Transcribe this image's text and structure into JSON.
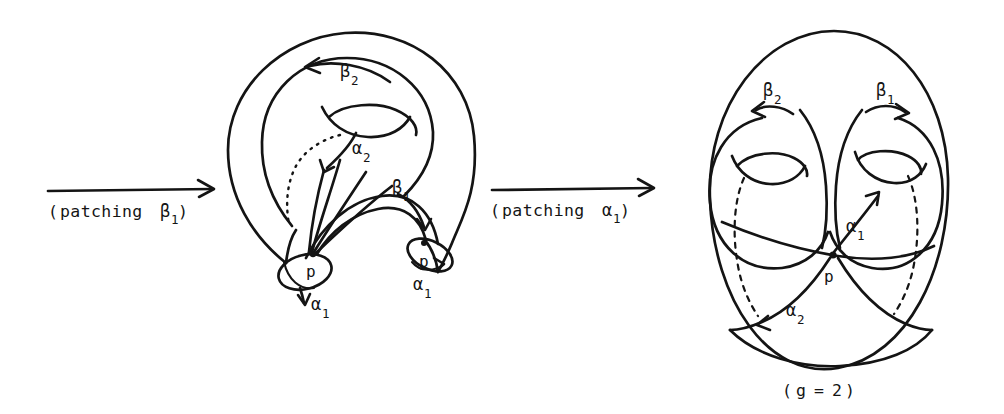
{
  "figure": {
    "kind": "mathematical-diagram",
    "background_color": "#ffffff",
    "ink_color": "#141414"
  },
  "transitions": [
    {
      "id": "arrow-patching-beta1",
      "open_paren": "(",
      "word": "patching",
      "symbol": "β",
      "subscript": "1",
      "close_paren": ")",
      "full_label": "(patching β₁)",
      "direction": "right"
    },
    {
      "id": "arrow-patching-alpha1",
      "open_paren": "(",
      "word": "patching",
      "symbol": "α",
      "subscript": "1",
      "close_paren": ")",
      "full_label": "(patching α₁)",
      "direction": "right"
    }
  ],
  "middle_figure": {
    "id": "surface-with-two-boundary-tubes",
    "description": "genus-one body with one hole and two open tubes ending in elliptical boundary circles",
    "labels": {
      "beta2": {
        "symbol": "β",
        "subscript": "2",
        "arrow_direction": "left"
      },
      "alpha2": {
        "symbol": "α",
        "subscript": "2",
        "arrow_direction": "down"
      },
      "beta1": {
        "symbol": "β",
        "subscript": "1",
        "arrow_direction": "down"
      },
      "alpha1_left": {
        "symbol": "α",
        "subscript": "1",
        "arrow_direction": "down"
      },
      "alpha1_right": {
        "symbol": "α",
        "subscript": "1",
        "arrow_direction": "right"
      }
    },
    "basepoints": [
      {
        "label": "p",
        "position": "left-tube-boundary"
      },
      {
        "label": "p",
        "position": "right-tube-boundary"
      }
    ]
  },
  "right_figure": {
    "id": "genus-two-surface",
    "description": "closed genus-two surface with two handles and four curves meeting at basepoint p",
    "labels": {
      "beta2": {
        "symbol": "β",
        "subscript": "2",
        "arrow_direction": "left"
      },
      "beta1": {
        "symbol": "β",
        "subscript": "1",
        "arrow_direction": "right"
      },
      "alpha1": {
        "symbol": "α",
        "subscript": "1",
        "arrow_direction": "up"
      },
      "alpha2": {
        "symbol": "α",
        "subscript": "2",
        "arrow_direction": "down-left"
      }
    },
    "basepoint": {
      "label": "p"
    },
    "caption": {
      "open_paren": "(",
      "variable": "g",
      "equals": "=",
      "value": "2",
      "close_paren": ")",
      "full_text": "(g = 2)"
    }
  }
}
